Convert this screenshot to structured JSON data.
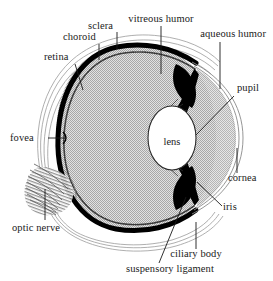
{
  "diagram": {
    "type": "anatomical-cross-section",
    "colors": {
      "background": "#ffffff",
      "interior_fill": "#c8c8c8",
      "choroid_stroke": "#000000",
      "sclera_stroke": "#b0b0b0",
      "lens_fill": "#ffffff",
      "iris_fill": "#000000",
      "text": "#1a1a1a"
    },
    "labels": [
      {
        "id": "retina",
        "text": "retina",
        "x": 44,
        "y": 60,
        "align": "left",
        "leader": {
          "type": "line",
          "x1": 75,
          "y1": 64,
          "x2": 83,
          "y2": 90
        }
      },
      {
        "id": "choroid",
        "text": "choroid",
        "x": 63,
        "y": 40,
        "align": "left",
        "leader": {
          "type": "line",
          "x1": 99,
          "y1": 44,
          "x2": 99,
          "y2": 60
        }
      },
      {
        "id": "sclera",
        "text": "sclera",
        "x": 88,
        "y": 29,
        "align": "left",
        "leader": {
          "type": "line",
          "x1": 117,
          "y1": 32,
          "x2": 117,
          "y2": 49
        }
      },
      {
        "id": "vitreous-humor",
        "text": "vitreous humor",
        "x": 161,
        "y": 22,
        "align": "center",
        "leader": {
          "type": "line",
          "x1": 161,
          "y1": 26,
          "x2": 161,
          "y2": 74
        }
      },
      {
        "id": "aqueous-humor",
        "text": "aqueous humor",
        "x": 254,
        "y": 37,
        "align": "right",
        "leader": {
          "type": "line",
          "x1": 220,
          "y1": 42,
          "x2": 220,
          "y2": 89
        }
      },
      {
        "id": "pupil",
        "text": "pupil",
        "x": 237,
        "y": 91,
        "align": "left",
        "leader": {
          "type": "line",
          "x1": 234,
          "y1": 96,
          "x2": 196,
          "y2": 135
        }
      },
      {
        "id": "cornea",
        "text": "cornea",
        "x": 230,
        "y": 180,
        "align": "left",
        "leader": {
          "type": "line",
          "x1": 237,
          "y1": 148,
          "x2": 237,
          "y2": 173
        }
      },
      {
        "id": "iris",
        "text": "iris",
        "x": 223,
        "y": 209,
        "align": "left",
        "leader": {
          "type": "line",
          "x1": 222,
          "y1": 206,
          "x2": 197,
          "y2": 182
        }
      },
      {
        "id": "ciliary-body",
        "text": "ciliary body",
        "x": 196,
        "y": 256,
        "align": "center",
        "leader": {
          "type": "line",
          "x1": 196,
          "y1": 249,
          "x2": 196,
          "y2": 222
        }
      },
      {
        "id": "suspensory-ligament",
        "text": "suspensory ligament",
        "x": 170,
        "y": 271,
        "align": "center",
        "leader": {
          "type": "line",
          "x1": 159,
          "y1": 263,
          "x2": 186,
          "y2": 197
        }
      },
      {
        "id": "fovea",
        "text": "fovea",
        "x": 10,
        "y": 141,
        "align": "left",
        "leader": {
          "type": "line",
          "x1": 48,
          "y1": 138,
          "x2": 65,
          "y2": 138
        }
      },
      {
        "id": "optic-nerve",
        "text": "optic nerve",
        "x": 12,
        "y": 231,
        "align": "left",
        "leader": {
          "type": "line",
          "x1": 45,
          "y1": 220,
          "x2": 45,
          "y2": 189
        }
      }
    ],
    "interior_labels": [
      {
        "id": "lens",
        "text": "lens",
        "x": 172,
        "y": 141
      }
    ]
  }
}
